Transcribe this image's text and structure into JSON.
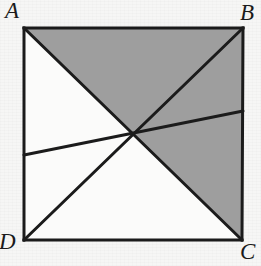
{
  "figure": {
    "kind": "geometry-diagram",
    "background_color": "#f6f6f5",
    "stroke_color": "#1b1b1b",
    "shade_color": "#9e9e9e",
    "unshaded_color": "#fbfbfa",
    "stroke_width": 3,
    "square": {
      "corners": {
        "A": {
          "x": 24,
          "y": 28
        },
        "B": {
          "x": 243,
          "y": 28
        },
        "C": {
          "x": 242,
          "y": 240
        },
        "D": {
          "x": 24,
          "y": 240
        }
      },
      "center": {
        "x": 133,
        "y": 134
      }
    },
    "segments": [
      {
        "name": "side-AB",
        "from": "A",
        "to": "B"
      },
      {
        "name": "side-BC",
        "from": "B",
        "to": "C"
      },
      {
        "name": "side-CD",
        "from": "C",
        "to": "D"
      },
      {
        "name": "side-DA",
        "from": "D",
        "to": "A"
      },
      {
        "name": "diagonal-AC",
        "from": "A",
        "to": "C"
      },
      {
        "name": "diagonal-BD",
        "from": "B",
        "to": "D"
      },
      {
        "name": "transversal-left-right",
        "from": {
          "x": 24,
          "y": 155
        },
        "to": {
          "x": 243,
          "y": 111
        }
      }
    ],
    "shaded_regions": [
      {
        "name": "triangle-A-B-center",
        "points": "24,28 243,28 133,134"
      },
      {
        "name": "triangle-B-C-center",
        "points": "243,28 242,240 133,134"
      }
    ],
    "labels": {
      "A": "A",
      "B": "B",
      "C": "C",
      "D": "D"
    }
  }
}
